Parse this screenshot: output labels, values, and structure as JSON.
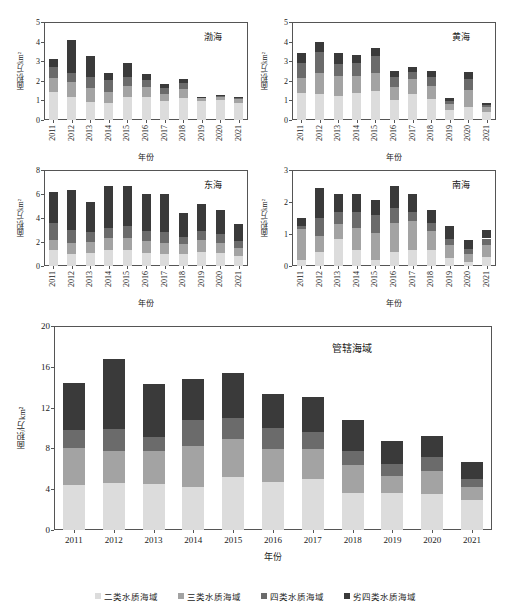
{
  "figure": {
    "background": "#ffffff",
    "axis_color": "#555555"
  },
  "legend": {
    "items": [
      {
        "label": "二类水质海域",
        "color": "#dcdcdc",
        "key": "class2"
      },
      {
        "label": "三类水质海域",
        "color": "#a3a3a3",
        "key": "class3"
      },
      {
        "label": "四类水质海域",
        "color": "#6b6b6b",
        "key": "class4"
      },
      {
        "label": "劣四类水质海域",
        "color": "#3a3a3a",
        "key": "worse4"
      }
    ]
  },
  "axis_titles": {
    "y": "面积/万km²",
    "x": "年份"
  },
  "chart_data": [
    {
      "id": "bohai",
      "type": "bar",
      "stacked": true,
      "title": "渤海",
      "xlabel": "年份",
      "ylabel": "面积/万km²",
      "ylim": [
        0,
        5
      ],
      "yticks": [
        0,
        1,
        2,
        3,
        4,
        5
      ],
      "grid": false,
      "categories": [
        "2011",
        "2012",
        "2013",
        "2014",
        "2015",
        "2016",
        "2017",
        "2018",
        "2019",
        "2020",
        "2021"
      ],
      "series": [
        {
          "name": "二类水质海域",
          "color": "#dcdcdc",
          "values": [
            1.45,
            1.15,
            0.9,
            0.85,
            1.15,
            1.15,
            0.95,
            1.1,
            0.95,
            1.0,
            0.85
          ]
        },
        {
          "name": "三类水质海域",
          "color": "#a3a3a3",
          "values": [
            0.7,
            0.8,
            0.75,
            0.6,
            0.6,
            0.55,
            0.4,
            0.5,
            0.15,
            0.15,
            0.2
          ]
        },
        {
          "name": "四类水质海域",
          "color": "#6b6b6b",
          "values": [
            0.55,
            0.45,
            0.55,
            0.6,
            0.45,
            0.35,
            0.3,
            0.3,
            0.05,
            0.08,
            0.08
          ]
        },
        {
          "name": "劣四类水质海域",
          "color": "#3a3a3a",
          "values": [
            0.4,
            1.7,
            1.05,
            0.35,
            0.7,
            0.3,
            0.2,
            0.2,
            0.03,
            0.03,
            0.03
          ]
        }
      ],
      "totals": [
        3.1,
        4.1,
        3.25,
        2.4,
        2.9,
        2.35,
        1.85,
        2.1,
        1.18,
        1.26,
        1.16
      ]
    },
    {
      "id": "huanghai",
      "type": "bar",
      "stacked": true,
      "title": "黄海",
      "xlabel": "年份",
      "ylabel": "面积/万km²",
      "ylim": [
        0,
        5
      ],
      "yticks": [
        0,
        1,
        2,
        3,
        4,
        5
      ],
      "grid": false,
      "categories": [
        "2011",
        "2012",
        "2013",
        "2014",
        "2015",
        "2016",
        "2017",
        "2018",
        "2019",
        "2020",
        "2021"
      ],
      "series": [
        {
          "name": "二类水质海域",
          "color": "#dcdcdc",
          "values": [
            1.4,
            1.35,
            1.2,
            1.4,
            1.5,
            1.0,
            1.35,
            1.05,
            0.5,
            0.65,
            0.4
          ]
        },
        {
          "name": "三类水质海域",
          "color": "#a3a3a3",
          "values": [
            0.75,
            1.05,
            1.05,
            0.85,
            0.9,
            0.7,
            0.75,
            0.7,
            0.3,
            0.9,
            0.25
          ]
        },
        {
          "name": "四类水质海域",
          "color": "#6b6b6b",
          "values": [
            0.75,
            1.05,
            0.6,
            0.65,
            0.85,
            0.5,
            0.35,
            0.45,
            0.18,
            0.55,
            0.12
          ]
        },
        {
          "name": "劣四类水质海域",
          "color": "#3a3a3a",
          "values": [
            0.5,
            0.55,
            0.55,
            0.4,
            0.45,
            0.3,
            0.25,
            0.3,
            0.12,
            0.35,
            0.08
          ]
        }
      ],
      "totals": [
        3.4,
        4.0,
        3.4,
        3.3,
        3.7,
        2.5,
        2.7,
        2.5,
        1.1,
        2.45,
        0.85
      ]
    },
    {
      "id": "donghai",
      "type": "bar",
      "stacked": true,
      "title": "东海",
      "xlabel": "年份",
      "ylabel": "面积/万km²",
      "ylim": [
        0,
        8
      ],
      "yticks": [
        0,
        2,
        4,
        6,
        8
      ],
      "grid": false,
      "categories": [
        "2011",
        "2012",
        "2013",
        "2014",
        "2015",
        "2016",
        "2017",
        "2018",
        "2019",
        "2020",
        "2021"
      ],
      "series": [
        {
          "name": "二类水质海域",
          "color": "#dcdcdc",
          "values": [
            1.3,
            1.0,
            1.1,
            1.35,
            1.3,
            1.1,
            1.0,
            1.0,
            1.2,
            1.05,
            0.8
          ]
        },
        {
          "name": "三类水质海域",
          "color": "#a3a3a3",
          "values": [
            0.85,
            0.95,
            0.9,
            1.0,
            1.05,
            0.95,
            0.95,
            0.85,
            0.95,
            0.9,
            0.7
          ]
        },
        {
          "name": "四类水质海域",
          "color": "#6b6b6b",
          "values": [
            1.4,
            1.05,
            0.8,
            0.8,
            0.95,
            0.9,
            0.9,
            0.6,
            0.75,
            0.7,
            0.55
          ]
        },
        {
          "name": "劣四类水质海域",
          "color": "#3a3a3a",
          "values": [
            2.65,
            3.3,
            2.5,
            3.55,
            3.35,
            3.05,
            3.15,
            1.95,
            2.3,
            2.05,
            1.45
          ]
        }
      ],
      "totals": [
        6.2,
        6.3,
        5.3,
        6.7,
        6.65,
        6.0,
        6.0,
        4.4,
        5.2,
        4.7,
        3.5
      ]
    },
    {
      "id": "nanhai",
      "type": "bar",
      "stacked": true,
      "title": "南海",
      "xlabel": "年份",
      "ylabel": "面积/万km²",
      "ylim": [
        0,
        3
      ],
      "yticks": [
        0,
        1,
        2,
        3
      ],
      "grid": false,
      "categories": [
        "2011",
        "2012",
        "2013",
        "2014",
        "2015",
        "2016",
        "2017",
        "2018",
        "2019",
        "2020",
        "2021"
      ],
      "series": [
        {
          "name": "二类水质海域",
          "color": "#dcdcdc",
          "values": [
            0.2,
            0.45,
            0.85,
            0.5,
            0.18,
            0.45,
            0.5,
            0.5,
            0.25,
            0.12,
            0.28
          ]
        },
        {
          "name": "三类水质海域",
          "color": "#a3a3a3",
          "values": [
            0.95,
            0.5,
            0.45,
            0.7,
            0.85,
            0.9,
            0.9,
            0.6,
            0.4,
            0.25,
            0.38
          ]
        },
        {
          "name": "四类水质海域",
          "color": "#6b6b6b",
          "values": [
            0.1,
            0.55,
            0.4,
            0.5,
            0.55,
            0.45,
            0.3,
            0.25,
            0.2,
            0.15,
            0.2
          ]
        },
        {
          "name": "劣四类水质海域",
          "color": "#3a3a3a",
          "values": [
            0.25,
            0.95,
            0.55,
            0.55,
            0.47,
            0.7,
            0.55,
            0.4,
            0.4,
            0.28,
            0.25
          ]
        }
      ],
      "totals": [
        1.5,
        2.45,
        2.25,
        2.25,
        2.05,
        2.5,
        2.25,
        1.75,
        1.25,
        0.8,
        1.11
      ]
    },
    {
      "id": "guanxia",
      "type": "bar",
      "stacked": true,
      "title": "管辖海域",
      "xlabel": "年份",
      "ylabel": "面积/万km²",
      "ylim": [
        0,
        20
      ],
      "yticks": [
        0,
        4,
        8,
        12,
        16,
        20
      ],
      "grid": false,
      "categories": [
        "2011",
        "2012",
        "2013",
        "2014",
        "2015",
        "2016",
        "2017",
        "2018",
        "2019",
        "2020",
        "2021"
      ],
      "series": [
        {
          "name": "二类水质海域",
          "color": "#dcdcdc",
          "values": [
            4.4,
            4.6,
            4.55,
            4.25,
            5.15,
            4.7,
            5.0,
            3.65,
            3.6,
            3.5,
            2.9
          ]
        },
        {
          "name": "三类水质海域",
          "color": "#a3a3a3",
          "values": [
            3.6,
            3.1,
            3.15,
            3.95,
            3.8,
            3.2,
            2.9,
            2.75,
            1.65,
            2.25,
            1.3
          ]
        },
        {
          "name": "四类水质海域",
          "color": "#6b6b6b",
          "values": [
            1.8,
            2.25,
            1.45,
            2.55,
            2.0,
            2.15,
            1.75,
            1.35,
            1.2,
            1.4,
            0.85
          ]
        },
        {
          "name": "劣四类水质海域",
          "color": "#3a3a3a",
          "values": [
            4.6,
            6.85,
            5.15,
            4.05,
            4.45,
            3.25,
            3.35,
            3.0,
            2.25,
            2.05,
            1.65
          ]
        }
      ],
      "totals": [
        14.4,
        16.8,
        14.3,
        14.8,
        15.4,
        13.3,
        13.0,
        10.75,
        8.7,
        9.2,
        6.7
      ]
    }
  ]
}
